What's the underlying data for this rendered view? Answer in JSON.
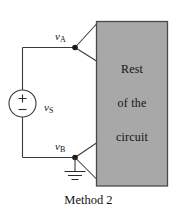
{
  "figure": {
    "caption": "Method 2",
    "background_color": "#ffffff",
    "line_color": "#3a3a3a"
  },
  "rest_of_circuit_block": {
    "fill_color": "#a8a8a8",
    "border_color": "#4a4a4a",
    "lines": [
      "Rest",
      "of the",
      "circuit"
    ]
  },
  "nodes": [
    {
      "id": "A",
      "symbol": "v",
      "subscript": "A",
      "label": "vA"
    },
    {
      "id": "B",
      "symbol": "v",
      "subscript": "B",
      "label": "vB"
    }
  ],
  "source": {
    "label_symbol": "v",
    "label_subscript": "S",
    "label": "vS",
    "plus_sign": "+",
    "minus_sign": "−",
    "type": "independent-voltage-source"
  },
  "ground": {
    "name": "ground-symbol",
    "bars": 3
  }
}
